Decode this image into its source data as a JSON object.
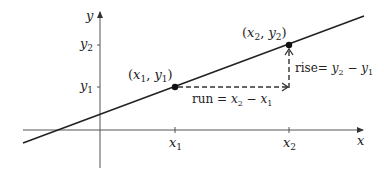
{
  "diagram": {
    "axes": {
      "x_label": "x",
      "y_label": "y"
    },
    "ticks": {
      "x": [
        {
          "label": "x",
          "sub": "1"
        },
        {
          "label": "x",
          "sub": "2"
        }
      ],
      "y": [
        {
          "label": "y",
          "sub": "1"
        },
        {
          "label": "y",
          "sub": "2"
        }
      ]
    },
    "points": [
      {
        "label": "(x1, y1)",
        "open": "(",
        "a": "x",
        "a_sub": "1",
        "sep": ", ",
        "b": "y",
        "b_sub": "1",
        "close": ")"
      },
      {
        "label": "(x2, y2)",
        "open": "(",
        "a": "x",
        "a_sub": "2",
        "sep": ", ",
        "b": "y",
        "b_sub": "2",
        "close": ")"
      }
    ],
    "run": {
      "word": "run",
      "eq": " = ",
      "a": "x",
      "a_sub": "2",
      "minus": " − ",
      "b": "x",
      "b_sub": "1"
    },
    "rise": {
      "word": "rise",
      "eq": "= ",
      "a": "y",
      "a_sub": "2",
      "minus": " − ",
      "b": "y",
      "b_sub": "1"
    },
    "colors": {
      "line": "#222222",
      "axis": "#555555",
      "background": "#ffffff"
    }
  }
}
